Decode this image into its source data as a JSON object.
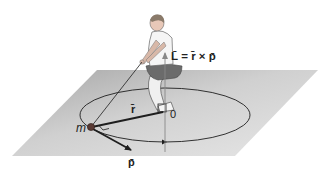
{
  "figure": {
    "colors": {
      "plane_light": "#e2e2e2",
      "plane_dark": "#a9a9a9",
      "lines": "#1e1e1e",
      "mass": "#5a3a34"
    },
    "labels": {
      "angular_momentum": "L̄ = r̄ × p̄",
      "position_vector": "r̄",
      "momentum_vector": "p̄",
      "origin": "0",
      "mass": "m"
    }
  }
}
